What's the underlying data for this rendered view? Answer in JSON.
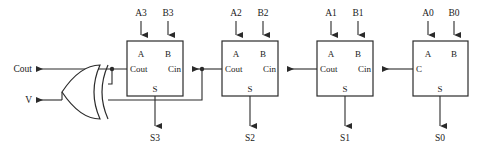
{
  "diagram": {
    "type": "logic-circuit-schematic",
    "colors": {
      "line": "#2b2b2b",
      "background": "#ffffff",
      "text": "#1a1a1a"
    },
    "outputs": {
      "cout_label": "Cout",
      "v_label": "V"
    },
    "gate": {
      "name": "xor-gate",
      "type": "XOR",
      "inputs": 2,
      "output_label": "V"
    },
    "stages": [
      {
        "index": 3,
        "input_a_label": "A3",
        "input_b_label": "B3",
        "port_a": "A",
        "port_b": "B",
        "port_cout": "Cout",
        "port_cin": "Cin",
        "port_s": "S",
        "sum_label": "S3"
      },
      {
        "index": 2,
        "input_a_label": "A2",
        "input_b_label": "B2",
        "port_a": "A",
        "port_b": "B",
        "port_cout": "Cout",
        "port_cin": "Cin",
        "port_s": "S",
        "sum_label": "S2"
      },
      {
        "index": 1,
        "input_a_label": "A1",
        "input_b_label": "B1",
        "port_a": "A",
        "port_b": "B",
        "port_cout": "Cout",
        "port_cin": "Cin",
        "port_s": "S",
        "sum_label": "S1"
      },
      {
        "index": 0,
        "input_a_label": "A0",
        "input_b_label": "B0",
        "port_a": "A",
        "port_b": "B",
        "port_cout": "C",
        "port_cin": "",
        "port_s": "S",
        "sum_label": "S0"
      }
    ]
  }
}
